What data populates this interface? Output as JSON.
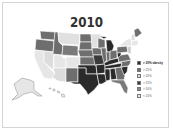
{
  "title": "2010",
  "colors": {
    "c30": "#2a2a2a",
    "c25": "#6e6e6e",
    "c20": "#dcdcdc",
    "c15": "#3c3c3c",
    "c10": "#8a8a8a",
    "c0": "#eeeeee",
    "border": "#d4d4d4"
  },
  "legend": [
    {
      "label": "> 30% obesity",
      "swatch": "#2a2a2a"
    },
    {
      "label": "> 25%",
      "swatch": "#6e6e6e"
    },
    {
      "label": "> 20%",
      "swatch": "#dcdcdc"
    },
    {
      "label": "> 15%",
      "swatch": "#3c3c3c"
    },
    {
      "label": "> 10%",
      "swatch": "#8a8a8a"
    },
    {
      "label": "< 10%",
      "swatch": "#eeeeee"
    }
  ],
  "regions": {
    "northwest": "> 25%",
    "montana_wyoming": "> 20%",
    "california_nevada_utah_arizona_colorado": "> 20%",
    "plains": "> 25%",
    "south": "> 30% obesity",
    "michigan": "> 30% obesity",
    "midwest": "> 25%",
    "northeast": "> 20%",
    "maine": "> 25%",
    "florida": "> 25%",
    "alaska": "> 20%",
    "hawaii": "> 20%"
  }
}
